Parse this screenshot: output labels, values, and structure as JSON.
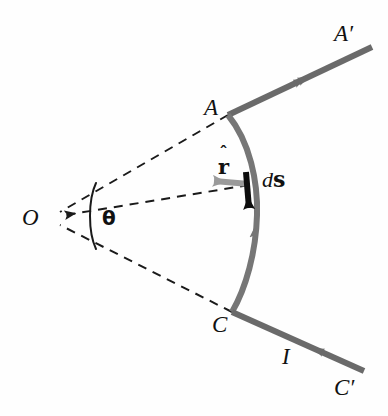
{
  "figure": {
    "type": "physics-diagram",
    "background_color": "#fefefe",
    "colors": {
      "wire": "#6a6a6a",
      "arc": "#767676",
      "dashed_line": "#1a1a1a",
      "ds_vector": "#0d0d0d",
      "rhat_vector": "#9a9a9a",
      "label_text": "#111111"
    },
    "labels": {
      "point_A": "A",
      "point_A_prime": "A′",
      "point_C": "C",
      "point_C_prime": "C′",
      "origin_O": "O",
      "current_I": "I",
      "angle_theta": "θ",
      "unit_vector_r_hat_hat": "ˆ",
      "unit_vector_r_hat_symbol": "r",
      "ds_d": "d",
      "ds_s": "s"
    },
    "geometry": {
      "origin": [
        52,
        218
      ],
      "point_A": [
        228,
        115
      ],
      "point_C": [
        232,
        312
      ],
      "arc_mid": [
        256,
        214
      ],
      "wire_upper_end": [
        372,
        47
      ],
      "wire_lower_end": [
        364,
        371
      ],
      "rhat_tail": [
        249,
        183
      ],
      "rhat_tip": [
        210,
        180
      ],
      "ds_tail": [
        247,
        175
      ],
      "ds_tip": [
        249,
        216
      ],
      "theta_arc_start": [
        94,
        183
      ],
      "theta_arc_end": [
        94,
        249
      ]
    }
  }
}
